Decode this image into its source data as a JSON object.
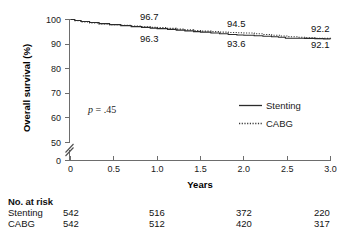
{
  "chart_data": {
    "type": "line",
    "title": "",
    "subtitle": "",
    "xlabel": "Years",
    "ylabel": "Overall survival (%)",
    "xlim": [
      0,
      3.0
    ],
    "ylim": [
      50,
      100
    ],
    "y_axis_break": true,
    "y_break_below_label": "0",
    "grid": false,
    "legend_position": "middle-right",
    "x_ticks": [
      "0",
      "0.5",
      "1.0",
      "1.5",
      "2.0",
      "2.5",
      "3.0"
    ],
    "x_tick_values": [
      0,
      0.5,
      1.0,
      1.5,
      2.0,
      2.5,
      3.0
    ],
    "y_ticks": [
      "100",
      "90",
      "80",
      "70",
      "60",
      "50",
      "0"
    ],
    "y_tick_values": [
      100,
      90,
      80,
      70,
      60,
      50,
      0
    ],
    "annotations": [
      {
        "name": "p-value",
        "text": "p = .45",
        "italic_prefix": "p"
      },
      {
        "name": "label-cabg-1yr",
        "text": "96.7",
        "series": "CABG",
        "x": 1.0,
        "value": 96.7
      },
      {
        "name": "label-stenting-1yr",
        "text": "96.3",
        "series": "Stenting",
        "x": 1.0,
        "value": 96.3
      },
      {
        "name": "label-cabg-2yr",
        "text": "94.5",
        "series": "CABG",
        "x": 2.0,
        "value": 94.5
      },
      {
        "name": "label-stenting-2yr",
        "text": "93.6",
        "series": "Stenting",
        "x": 2.0,
        "value": 93.6
      },
      {
        "name": "label-cabg-3yr",
        "text": "92.2",
        "series": "CABG",
        "x": 3.0,
        "value": 92.2
      },
      {
        "name": "label-stenting-3yr",
        "text": "92.1",
        "series": "Stenting",
        "x": 3.0,
        "value": 92.1
      }
    ],
    "series": [
      {
        "name": "Stenting",
        "style": "solid",
        "color": "#2b2b2b",
        "x": [
          0.0,
          0.05,
          0.12,
          0.22,
          0.33,
          0.45,
          0.58,
          0.7,
          0.82,
          0.92,
          1.0,
          1.12,
          1.22,
          1.32,
          1.42,
          1.5,
          1.62,
          1.72,
          1.82,
          1.92,
          2.0,
          2.12,
          2.22,
          2.32,
          2.4,
          2.48,
          2.58,
          2.7,
          2.82,
          2.92,
          3.0
        ],
        "values": [
          100.0,
          99.6,
          99.2,
          98.8,
          98.3,
          97.9,
          97.5,
          97.1,
          96.8,
          96.5,
          96.3,
          96.0,
          95.7,
          95.4,
          95.1,
          94.9,
          94.5,
          94.2,
          93.9,
          93.7,
          93.6,
          93.4,
          93.2,
          93.0,
          92.8,
          92.4,
          92.4,
          92.3,
          92.2,
          92.1,
          92.1
        ]
      },
      {
        "name": "CABG",
        "style": "dotted",
        "color": "#3a3a3a",
        "x": [
          0.0,
          0.05,
          0.12,
          0.22,
          0.33,
          0.45,
          0.58,
          0.7,
          0.82,
          0.92,
          1.0,
          1.12,
          1.22,
          1.32,
          1.42,
          1.5,
          1.62,
          1.72,
          1.82,
          1.92,
          2.0,
          2.12,
          2.22,
          2.32,
          2.42,
          2.52,
          2.62,
          2.72,
          2.82,
          2.92,
          3.0
        ],
        "values": [
          100.0,
          99.5,
          99.0,
          98.6,
          98.2,
          97.9,
          97.6,
          97.3,
          97.0,
          96.8,
          96.7,
          96.4,
          96.1,
          95.8,
          95.5,
          95.3,
          95.1,
          94.9,
          94.7,
          94.6,
          94.5,
          94.2,
          93.9,
          93.6,
          93.3,
          93.0,
          92.8,
          92.6,
          92.4,
          92.3,
          92.2
        ]
      }
    ],
    "risk_table": {
      "header": "No. at risk",
      "x_positions": [
        0,
        1.0,
        2.0,
        3.0
      ],
      "rows": [
        {
          "label": "Stenting",
          "values": [
            "542",
            "516",
            "372",
            "220"
          ]
        },
        {
          "label": "CABG",
          "values": [
            "542",
            "512",
            "420",
            "317"
          ]
        }
      ]
    }
  }
}
